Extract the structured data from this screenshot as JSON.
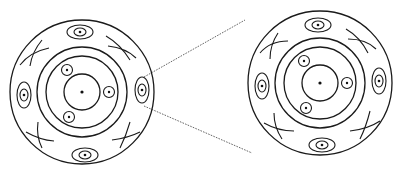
{
  "diagram": {
    "stroke_color": "#1a1a1a",
    "zoom_line_color": "#555555",
    "background": "#ffffff",
    "left_section": {
      "center": [
        82,
        92
      ],
      "outer_radius": 72,
      "ring_radius_outer": 44,
      "ring_radius_inner": 36,
      "core_radius": 19,
      "small_circles": 3,
      "eye_ellipses": 4,
      "crossing_arcs": 4
    },
    "right_section": {
      "center": [
        320,
        83
      ],
      "outer_radius": 72,
      "ring_radius_outer": 44,
      "ring_radius_inner": 36,
      "core_radius": 19,
      "small_circles": 3,
      "eye_ellipses": 4,
      "crossing_arcs": 4
    },
    "connector": {
      "style": "dotted",
      "from": "left section right-side ellipse",
      "to": "right section outer edge"
    }
  }
}
